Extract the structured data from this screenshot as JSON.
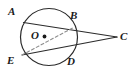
{
  "figure": {
    "type": "circle-with-two-secants",
    "background_color": "#ffffff",
    "stroke_color": "#2b2b2b",
    "label_color": "#1a1a1a"
  },
  "labels": {
    "A": "A",
    "B": "B",
    "C": "C",
    "D": "D",
    "E": "E",
    "O": "O"
  },
  "geometry": {
    "circle": {
      "center_x": 49,
      "center_y": 37,
      "radius": 28.5,
      "style": "solid"
    },
    "center_dot": {
      "x": 44.5,
      "y": 36.5,
      "radius": 1.8
    },
    "points": {
      "A": {
        "x": 23.5,
        "y": 22.5
      },
      "B": {
        "x": 73.5,
        "y": 27.5
      },
      "C": {
        "x": 117.0,
        "y": 37.0
      },
      "D": {
        "x": 70.0,
        "y": 57.5
      },
      "E": {
        "x": 22.0,
        "y": 55.0
      },
      "O": {
        "x": 44.5,
        "y": 36.5
      }
    },
    "segments": [
      {
        "name": "secant-A-B-C",
        "from": "A",
        "to": "C",
        "style": "solid"
      },
      {
        "name": "secant-E-D-C",
        "from": "E",
        "to": "C",
        "style": "solid"
      },
      {
        "name": "chord-E-B",
        "from": "E",
        "to": "B",
        "style": "dashed"
      }
    ]
  }
}
